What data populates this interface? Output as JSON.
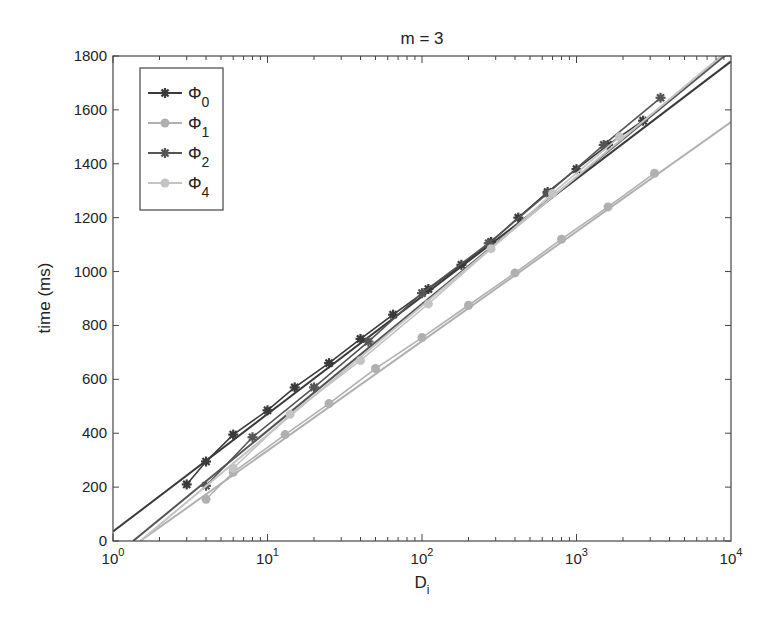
{
  "chart_data": {
    "type": "line",
    "title": "m = 3",
    "xlabel": "D_i",
    "ylabel": "time  (ms)",
    "xscale": "log",
    "xlim": [
      1,
      10000
    ],
    "ylim": [
      0,
      1800
    ],
    "xticks": [
      1,
      10,
      100,
      1000,
      10000
    ],
    "xtick_labels": [
      "10^0",
      "10^1",
      "10^2",
      "10^3",
      "10^4"
    ],
    "yticks": [
      0,
      200,
      400,
      600,
      800,
      1000,
      1200,
      1400,
      1600,
      1800
    ],
    "grid": false,
    "legend_position": "upper left",
    "series": [
      {
        "name": "Φ0",
        "sub": "0",
        "color": "#3a3a3a",
        "marker": "star",
        "x": [
          3,
          4,
          6,
          10,
          15,
          25,
          40,
          65,
          110,
          180,
          280,
          420,
          650,
          1000,
          1600,
          2700
        ],
        "y": [
          210,
          295,
          395,
          485,
          570,
          660,
          750,
          840,
          935,
          1025,
          1110,
          1200,
          1295,
          1380,
          1470,
          1560
        ],
        "fit": {
          "x": [
            1,
            10000
          ],
          "y": [
            35,
            1780
          ]
        }
      },
      {
        "name": "Φ1",
        "sub": "1",
        "color": "#b0b0b0",
        "marker": "circle",
        "x": [
          4,
          6,
          13,
          25,
          50,
          100,
          200,
          400,
          800,
          1600,
          3200
        ],
        "y": [
          155,
          255,
          395,
          510,
          640,
          755,
          875,
          995,
          1120,
          1240,
          1365
        ],
        "fit": {
          "x": [
            1.5,
            10000
          ],
          "y": [
            0,
            1555
          ]
        }
      },
      {
        "name": "Φ2",
        "sub": "2",
        "color": "#555555",
        "marker": "star",
        "x": [
          4,
          8,
          20,
          45,
          100,
          270,
          650,
          1500,
          3500
        ],
        "y": [
          205,
          385,
          570,
          740,
          920,
          1105,
          1290,
          1470,
          1645
        ],
        "fit": {
          "x": [
            1.35,
            10000
          ],
          "y": [
            0,
            1820
          ]
        }
      },
      {
        "name": "Φ4",
        "sub": "4",
        "color": "#c4c4c4",
        "marker": "circle",
        "x": [
          6,
          14,
          40,
          110,
          280,
          700,
          1900
        ],
        "y": [
          270,
          470,
          670,
          880,
          1085,
          1290,
          1500
        ],
        "fit": {
          "x": [
            1.5,
            10000
          ],
          "y": [
            0,
            1830
          ]
        }
      }
    ]
  }
}
